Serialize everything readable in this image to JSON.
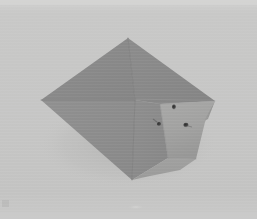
{
  "image": {
    "title": "Folded paper object on light gray surface",
    "subject": "folded-paper-sheet",
    "medium": "photograph",
    "palette": "grayscale",
    "width_px": 257,
    "height_px": 219
  },
  "colors": {
    "background_surface": "#c6c6c5",
    "background_top_band": "#cfcfce",
    "background_bottom_band": "#c2c2c1",
    "facet_dark": "#8a8a8a",
    "facet_dark_upper": "#888888",
    "facet_dark_left": "#8d8d8d",
    "facet_dark_lower": "#8c8c8c",
    "facet_mid": "#9a9a9a",
    "facet_light": "#a4a4a3",
    "facet_light_lower": "#9e9e9d",
    "facet_flap": "#8e8e8e",
    "crease_line": "#7e7e7e",
    "crease_highlight": "#a0a09f",
    "speck_dark": "#3f3f3f",
    "shadow_soft": "#b4b4b3",
    "smudge_light": "#d2d2d1"
  },
  "geometry": {
    "main_sheet_outline": "128,38 215,101 205,120 196,160 162,176 132,180 41,100",
    "facets": [
      {
        "name": "upper-left-facet",
        "points": "128,38 135,100 41,100",
        "fill_key": "facet_dark_upper"
      },
      {
        "name": "lower-left-facet",
        "points": "41,100 135,100 132,180",
        "fill_key": "facet_dark_left"
      },
      {
        "name": "upper-right-facet",
        "points": "128,38 215,101 160,104 135,100",
        "fill_key": "facet_dark"
      },
      {
        "name": "lower-center-facet",
        "points": "135,100 160,104 168,158 132,180",
        "fill_key": "facet_dark_lower"
      },
      {
        "name": "right-light-facet",
        "points": "160,104 215,101 205,122 196,159 168,158",
        "fill_key": "facet_light"
      },
      {
        "name": "right-flap-lower",
        "points": "168,158 196,159 180,170 150,176 132,180",
        "fill_key": "facet_light_lower"
      },
      {
        "name": "right-edge-flap",
        "points": "205,122 215,101 207,118",
        "fill_key": "facet_mid"
      }
    ],
    "creases": [
      {
        "name": "crease-top-to-center",
        "path": "128,38 135,100"
      },
      {
        "name": "crease-left-to-center",
        "path": "41,100 135,100"
      },
      {
        "name": "crease-center-to-bottom",
        "path": "135,100 132,180"
      },
      {
        "name": "crease-center-to-right",
        "path": "135,100 160,104"
      },
      {
        "name": "crease-right-diagonal",
        "path": "160,104 168,158"
      },
      {
        "name": "crease-right-fold",
        "path": "160,104 215,101"
      },
      {
        "name": "crease-lower-right-fold",
        "path": "168,158 196,159"
      }
    ],
    "specks": [
      {
        "name": "speck-upper",
        "cx": 174,
        "cy": 107,
        "rx": 2.0,
        "ry": 2.4
      },
      {
        "name": "speck-left",
        "cx": 159,
        "cy": 124,
        "rx": 2.2,
        "ry": 2.0
      },
      {
        "name": "speck-right",
        "cx": 186,
        "cy": 125,
        "rx": 2.6,
        "ry": 2.2
      }
    ],
    "surface_marks": [
      {
        "name": "corner-smudge-bottom-left",
        "x": 2,
        "y": 200,
        "w": 7,
        "h": 7
      },
      {
        "name": "surface-smudge-bottom-center",
        "x": 128,
        "y": 205,
        "w": 16,
        "h": 4
      }
    ]
  },
  "labels": {
    "alt_text": "Grayscale photograph of a folded sheet of paper forming an angular kite-like shape with several flat facets, crease lines radiating from a central point, and three small dark specks on the lighter right-hand facet.",
    "object_name": "folded paper sheet",
    "surface_name": "light gray table surface"
  }
}
